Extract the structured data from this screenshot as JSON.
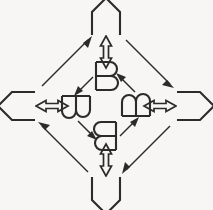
{
  "figure": {
    "title": "Rotation symmetry diagram of the letter B",
    "background_color": "#f7f6f4",
    "stroke_color": "#2b2b2b",
    "width": 213,
    "height": 210
  },
  "inner_nodes": [
    {
      "id": "inner-top",
      "label": "B",
      "orientation": "upright",
      "rotation_degrees": 0,
      "x": 106,
      "y": 76
    },
    {
      "id": "inner-left",
      "label": "B",
      "orientation": "rotated-90-clockwise",
      "rotation_degrees": 90,
      "x": 76,
      "y": 106
    },
    {
      "id": "inner-bottom",
      "label": "B",
      "orientation": "rotated-180",
      "rotation_degrees": 180,
      "x": 106,
      "y": 136
    },
    {
      "id": "inner-right",
      "label": "B",
      "orientation": "rotated-270-clockwise",
      "rotation_degrees": 270,
      "x": 136,
      "y": 106
    }
  ],
  "outer_nodes": [
    {
      "id": "outer-top",
      "label": "pentagon-arrow-up",
      "orientation": "pointing-up",
      "rotation_degrees": 0,
      "x": 106,
      "y": 24
    },
    {
      "id": "outer-left",
      "label": "pentagon-arrow-left",
      "orientation": "pointing-left",
      "rotation_degrees": 90,
      "x": 24,
      "y": 106
    },
    {
      "id": "outer-bottom",
      "label": "pentagon-arrow-down",
      "orientation": "pointing-down",
      "rotation_degrees": 180,
      "x": 106,
      "y": 188
    },
    {
      "id": "outer-right",
      "label": "pentagon-arrow-right",
      "orientation": "pointing-right",
      "rotation_degrees": 270,
      "x": 188,
      "y": 106
    }
  ],
  "radial_arrows": [
    {
      "id": "radial-top",
      "style": "double-headed-hollow",
      "direction": "vertical",
      "from": "inner-top",
      "to": "outer-top"
    },
    {
      "id": "radial-left",
      "style": "double-headed-hollow",
      "direction": "horizontal",
      "from": "inner-left",
      "to": "outer-left"
    },
    {
      "id": "radial-bottom",
      "style": "double-headed-hollow",
      "direction": "vertical",
      "from": "inner-bottom",
      "to": "outer-bottom"
    },
    {
      "id": "radial-right",
      "style": "double-headed-hollow",
      "direction": "horizontal",
      "from": "inner-right",
      "to": "outer-right"
    }
  ],
  "inner_cycle_arrows": [
    {
      "id": "inner-arrow-top-left",
      "style": "single-headed-solid",
      "from": "inner-top",
      "to": "inner-left"
    },
    {
      "id": "inner-arrow-left-bottom",
      "style": "single-headed-solid",
      "from": "inner-left",
      "to": "inner-bottom"
    },
    {
      "id": "inner-arrow-bottom-right",
      "style": "single-headed-solid",
      "from": "inner-bottom",
      "to": "inner-right"
    },
    {
      "id": "inner-arrow-right-top",
      "style": "single-headed-solid",
      "from": "inner-right",
      "to": "inner-top"
    }
  ],
  "outer_cycle_arrows": [
    {
      "id": "outer-arrow-left-top",
      "style": "single-headed-solid",
      "from": "outer-left",
      "to": "outer-top"
    },
    {
      "id": "outer-arrow-top-right",
      "style": "single-headed-solid",
      "from": "outer-top",
      "to": "outer-right"
    },
    {
      "id": "outer-arrow-right-bottom",
      "style": "single-headed-solid",
      "from": "outer-right",
      "to": "outer-bottom"
    },
    {
      "id": "outer-arrow-bottom-left",
      "style": "single-headed-solid",
      "from": "outer-bottom",
      "to": "outer-left"
    }
  ]
}
